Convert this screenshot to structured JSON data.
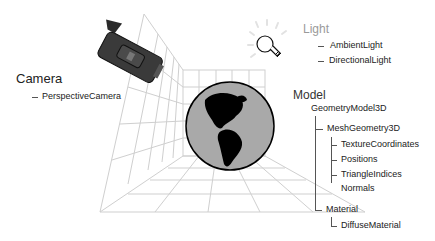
{
  "diagram": {
    "camera": {
      "heading": "Camera",
      "children": [
        "PerspectiveCamera"
      ],
      "icon": "video-camera-icon"
    },
    "light": {
      "heading": "Light",
      "children": [
        "AmbientLight",
        "DirectionalLight"
      ],
      "icon": "light-bulb-icon"
    },
    "model": {
      "heading": "Model",
      "root": "GeometryModel3D",
      "geometry": {
        "label": "MeshGeometry3D",
        "children": [
          "TextureCoordinates",
          "Positions",
          "TriangleIndices",
          "Normals"
        ]
      },
      "material": {
        "label": "Material",
        "children": [
          "DiffuseMaterial"
        ]
      },
      "icon": "globe-icon"
    },
    "colors": {
      "grid": "#cfcfcf",
      "globe_ocean": "#a9a9a9",
      "globe_land": "#000000",
      "camera_body": "#3a3a3a",
      "light_heading": "#9a9a9a"
    }
  }
}
